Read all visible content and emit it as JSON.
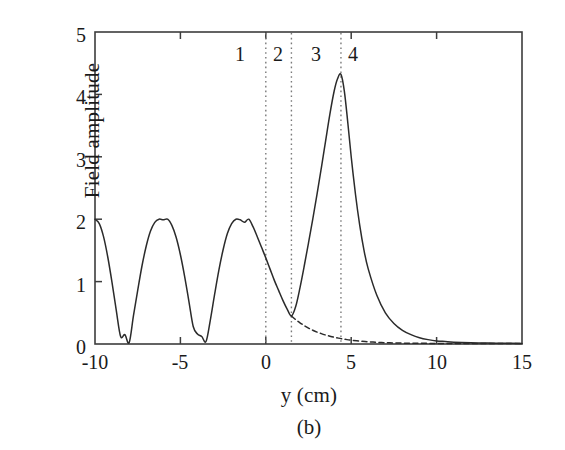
{
  "figure": {
    "caption": "(b)",
    "axis_color": "#3d3d3d",
    "curve_color": "#2b2b2b",
    "marker_color": "#7a7a7a"
  },
  "chart_data": {
    "type": "line",
    "title": "",
    "subtitle": "",
    "caption": "(b)",
    "xlabel": "y (cm)",
    "ylabel": "Field amplitude",
    "xlim": [
      -10,
      15
    ],
    "ylim": [
      0,
      5
    ],
    "xticks": [
      -10,
      -5,
      0,
      5,
      10,
      15
    ],
    "xtick_labels": [
      "-10",
      "-5",
      "0",
      "5",
      "10",
      "15"
    ],
    "yticks": [
      0,
      1,
      2,
      3,
      4,
      5
    ],
    "ytick_labels": [
      "0",
      "1",
      "2",
      "3",
      "4",
      "5"
    ],
    "grid": false,
    "legend": null,
    "annotations": [
      {
        "text": "1",
        "x": -1.5,
        "y": 4.62,
        "kind": "region-label"
      },
      {
        "text": "2",
        "x": 0.72,
        "y": 4.62,
        "kind": "region-label"
      },
      {
        "text": "3",
        "x": 2.95,
        "y": 4.62,
        "kind": "region-label"
      },
      {
        "text": "4",
        "x": 5.1,
        "y": 4.62,
        "kind": "region-label"
      }
    ],
    "vertical_lines": [
      {
        "x": 0.0,
        "style": "dotted",
        "color": "#7a7a7a"
      },
      {
        "x": 1.5,
        "style": "dotted",
        "color": "#7a7a7a"
      },
      {
        "x": 4.4,
        "style": "dotted",
        "color": "#7a7a7a"
      }
    ],
    "series": [
      {
        "name": "total field",
        "style": "solid",
        "color": "#2b2b2b",
        "x": [
          -10.0,
          -9.75,
          -9.5,
          -9.25,
          -9.0,
          -8.75,
          -8.5,
          -8.25,
          -8.0,
          -7.75,
          -7.5,
          -7.25,
          -7.0,
          -6.75,
          -6.5,
          -6.25,
          -6.0,
          -5.75,
          -5.5,
          -5.25,
          -5.0,
          -4.75,
          -4.5,
          -4.25,
          -4.0,
          -3.75,
          -3.5,
          -3.25,
          -3.0,
          -2.75,
          -2.5,
          -2.25,
          -2.0,
          -1.75,
          -1.5,
          -1.25,
          -1.0,
          -0.75,
          -0.5,
          -0.25,
          0.0,
          0.25,
          0.5,
          0.75,
          1.0,
          1.25,
          1.5,
          1.75,
          2.0,
          2.25,
          2.5,
          2.75,
          3.0,
          3.25,
          3.5,
          3.75,
          4.0,
          4.2,
          4.4,
          4.6,
          4.8,
          5.0,
          5.25,
          5.5,
          5.75,
          6.0,
          6.5,
          7.0,
          7.5,
          8.0,
          8.5,
          9.0,
          9.5,
          10.0,
          10.5,
          11.0,
          12.0,
          13.0,
          14.0,
          15.0
        ],
        "y": [
          2.0,
          1.93,
          1.72,
          1.39,
          0.98,
          0.53,
          0.12,
          0.15,
          0.02,
          0.45,
          0.86,
          1.25,
          1.57,
          1.81,
          1.95,
          2.0,
          1.99,
          2.0,
          1.9,
          1.71,
          1.43,
          1.08,
          0.68,
          0.28,
          0.16,
          0.12,
          0.04,
          0.38,
          0.79,
          1.18,
          1.51,
          1.77,
          1.93,
          2.0,
          1.99,
          1.95,
          2.0,
          1.88,
          1.72,
          1.55,
          1.38,
          1.2,
          1.02,
          0.86,
          0.7,
          0.56,
          0.45,
          0.6,
          0.9,
          1.25,
          1.62,
          2.0,
          2.4,
          2.82,
          3.25,
          3.68,
          4.05,
          4.25,
          4.32,
          4.05,
          3.55,
          3.0,
          2.4,
          1.9,
          1.5,
          1.2,
          0.78,
          0.5,
          0.33,
          0.22,
          0.15,
          0.1,
          0.07,
          0.05,
          0.04,
          0.03,
          0.02,
          0.015,
          0.012,
          0.01
        ]
      },
      {
        "name": "decaying field",
        "style": "dashed",
        "color": "#2b2b2b",
        "x": [
          1.5,
          1.75,
          2.0,
          2.25,
          2.5,
          2.75,
          3.0,
          3.25,
          3.5,
          3.75,
          4.0,
          4.25,
          4.5,
          4.75,
          5.0,
          5.5,
          6.0,
          6.5,
          7.0,
          7.5,
          8.0,
          8.5,
          9.0,
          9.5,
          10.0,
          10.5,
          11.0,
          12.0,
          13.0,
          14.0,
          15.0
        ],
        "y": [
          0.45,
          0.39,
          0.34,
          0.295,
          0.255,
          0.221,
          0.191,
          0.166,
          0.144,
          0.125,
          0.108,
          0.094,
          0.081,
          0.07,
          0.061,
          0.046,
          0.035,
          0.027,
          0.021,
          0.017,
          0.014,
          0.012,
          0.011,
          0.01,
          0.01,
          0.009,
          0.009,
          0.008,
          0.008,
          0.007,
          0.007
        ]
      }
    ]
  }
}
